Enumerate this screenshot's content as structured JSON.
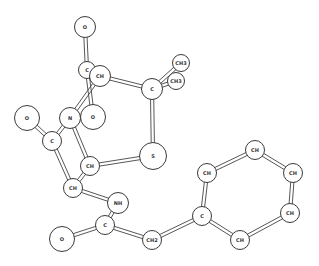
{
  "diagram": {
    "type": "ball-and-stick molecular model",
    "atoms": [
      {
        "id": "o1",
        "label": "O",
        "x": 85,
        "y": 27,
        "r": 11
      },
      {
        "id": "c1",
        "label": "C",
        "x": 87,
        "y": 70,
        "r": 9
      },
      {
        "id": "ch1",
        "label": "CH",
        "x": 100,
        "y": 76,
        "r": 11
      },
      {
        "id": "o2",
        "label": "O",
        "x": 93,
        "y": 117,
        "r": 13
      },
      {
        "id": "c2",
        "label": "C",
        "x": 152,
        "y": 89,
        "r": 11
      },
      {
        "id": "ch3a",
        "label": "CH3",
        "x": 181,
        "y": 63,
        "r": 9
      },
      {
        "id": "ch3b",
        "label": "CH3",
        "x": 176,
        "y": 81,
        "r": 9
      },
      {
        "id": "o3",
        "label": "O",
        "x": 27,
        "y": 118,
        "r": 13
      },
      {
        "id": "n1",
        "label": "N",
        "x": 70,
        "y": 118,
        "r": 11
      },
      {
        "id": "c3",
        "label": "C",
        "x": 52,
        "y": 141,
        "r": 10
      },
      {
        "id": "ch2",
        "label": "CH",
        "x": 90,
        "y": 166,
        "r": 10
      },
      {
        "id": "s1",
        "label": "S",
        "x": 153,
        "y": 156,
        "r": 14
      },
      {
        "id": "ch4",
        "label": "CH",
        "x": 73,
        "y": 188,
        "r": 10
      },
      {
        "id": "nh1",
        "label": "NH",
        "x": 118,
        "y": 203,
        "r": 11
      },
      {
        "id": "c4",
        "label": "C",
        "x": 105,
        "y": 225,
        "r": 10
      },
      {
        "id": "o4",
        "label": "O",
        "x": 62,
        "y": 239,
        "r": 13
      },
      {
        "id": "ch2b",
        "label": "CH2",
        "x": 152,
        "y": 240,
        "r": 10
      },
      {
        "id": "c5",
        "label": "C",
        "x": 202,
        "y": 216,
        "r": 10
      },
      {
        "id": "ch5",
        "label": "CH",
        "x": 207,
        "y": 173,
        "r": 10
      },
      {
        "id": "ch6",
        "label": "CH",
        "x": 255,
        "y": 150,
        "r": 10
      },
      {
        "id": "ch7",
        "label": "CH",
        "x": 293,
        "y": 173,
        "r": 10
      },
      {
        "id": "ch8",
        "label": "CH",
        "x": 290,
        "y": 213,
        "r": 10
      },
      {
        "id": "ch9",
        "label": "CH",
        "x": 240,
        "y": 240,
        "r": 10
      }
    ],
    "bonds": [
      [
        "o1",
        "c1"
      ],
      [
        "c1",
        "ch1"
      ],
      [
        "c1",
        "o2"
      ],
      [
        "ch1",
        "c2"
      ],
      [
        "ch1",
        "n1"
      ],
      [
        "c2",
        "ch3a"
      ],
      [
        "c2",
        "ch3b"
      ],
      [
        "c2",
        "s1"
      ],
      [
        "o3",
        "c3"
      ],
      [
        "n1",
        "c3"
      ],
      [
        "n1",
        "ch2"
      ],
      [
        "c3",
        "ch4"
      ],
      [
        "ch2",
        "ch4"
      ],
      [
        "ch2",
        "s1"
      ],
      [
        "ch4",
        "nh1"
      ],
      [
        "nh1",
        "c4"
      ],
      [
        "c4",
        "o4"
      ],
      [
        "c4",
        "ch2b"
      ],
      [
        "ch2b",
        "c5"
      ],
      [
        "c5",
        "ch5"
      ],
      [
        "ch5",
        "ch6"
      ],
      [
        "ch6",
        "ch7"
      ],
      [
        "ch7",
        "ch8"
      ],
      [
        "ch8",
        "ch9"
      ],
      [
        "ch9",
        "c5"
      ]
    ]
  }
}
